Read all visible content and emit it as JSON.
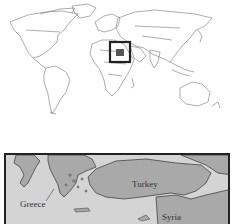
{
  "world_map": {
    "style": "outline",
    "land_stroke": "#8a8a8a",
    "highlight_box": {
      "x": 110,
      "y": 42,
      "w": 20,
      "h": 20,
      "stroke": "#222222"
    }
  },
  "inset_map": {
    "sea_color": "#d4d4d4",
    "land_color": "#a9a9a9",
    "border_color": "#222222",
    "labels": [
      {
        "text": "Turkey"
      },
      {
        "text": "Greece"
      },
      {
        "text": "Syria"
      }
    ]
  }
}
